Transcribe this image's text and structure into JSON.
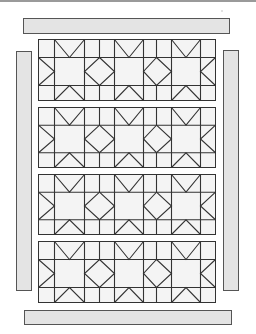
{
  "diagram": {
    "title": "",
    "colors": {
      "background": "#ffffff",
      "strip_fill": "#e4e4e4",
      "strip_stroke": "#555555",
      "block_fill": "#f4f4f4",
      "line": "#333333"
    },
    "borders": {
      "top": {
        "x": 23,
        "y": 18,
        "w": 206,
        "h": 15
      },
      "bottom": {
        "x": 24,
        "y": 310,
        "w": 207,
        "h": 14
      },
      "left": {
        "x": 16,
        "y": 51,
        "w": 15,
        "h": 239
      },
      "right": {
        "x": 223,
        "y": 50,
        "w": 15,
        "h": 240
      }
    },
    "grid": {
      "x_lines": [
        38,
        54,
        84,
        99,
        114,
        143,
        156,
        171,
        200,
        215
      ],
      "row_count": 4,
      "stars_per_row": 3
    },
    "rows": [
      {
        "top": 39,
        "bottom": 100
      },
      {
        "top": 107,
        "bottom": 167
      },
      {
        "top": 174,
        "bottom": 234
      },
      {
        "top": 241,
        "bottom": 302
      }
    ]
  }
}
